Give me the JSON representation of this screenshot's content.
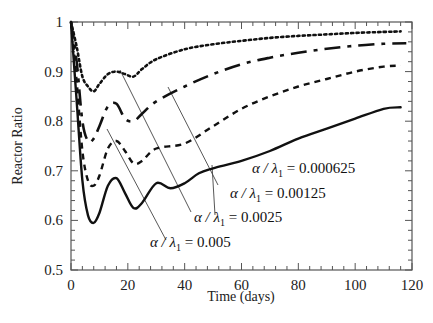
{
  "chart_data": {
    "type": "line",
    "title": "",
    "xlabel": "Time (days)",
    "ylabel": "Reactor Ratio",
    "xlim": [
      0,
      120
    ],
    "ylim": [
      0.5,
      1.0
    ],
    "xticks": [
      0,
      20,
      40,
      60,
      80,
      100,
      120
    ],
    "yticks": [
      0.5,
      0.6,
      0.7,
      0.8,
      0.9,
      1.0
    ],
    "xtick_labels": [
      "0",
      "20",
      "40",
      "60",
      "80",
      "100",
      "120"
    ],
    "ytick_labels": [
      "0.5",
      "0.6",
      "0.7",
      "0.8",
      "0.9",
      "1"
    ],
    "grid": false,
    "legend": "inline annotations with leader lines",
    "series": [
      {
        "name": "α/λ1 = 0.000625",
        "style": "dotted",
        "x": [
          0,
          2,
          4,
          6,
          8,
          10,
          13,
          16,
          19,
          22,
          25,
          30,
          40,
          50,
          60,
          70,
          80,
          90,
          100,
          110,
          116
        ],
        "y": [
          1.0,
          0.95,
          0.89,
          0.87,
          0.86,
          0.875,
          0.895,
          0.9,
          0.895,
          0.89,
          0.905,
          0.925,
          0.945,
          0.955,
          0.962,
          0.968,
          0.972,
          0.975,
          0.978,
          0.98,
          0.981
        ]
      },
      {
        "name": "α/λ1 = 0.00125",
        "style": "long-dash",
        "x": [
          0,
          2,
          4,
          6,
          8,
          10,
          13,
          16,
          19,
          22,
          25,
          30,
          40,
          50,
          60,
          70,
          80,
          90,
          100,
          110,
          118
        ],
        "y": [
          1.0,
          0.92,
          0.8,
          0.76,
          0.765,
          0.79,
          0.83,
          0.835,
          0.805,
          0.8,
          0.815,
          0.84,
          0.87,
          0.895,
          0.915,
          0.928,
          0.938,
          0.946,
          0.952,
          0.956,
          0.957
        ]
      },
      {
        "name": "α/λ1 = 0.0025",
        "style": "short-dash",
        "x": [
          0,
          2,
          4,
          6,
          8,
          10,
          13,
          16,
          19,
          22,
          25,
          30,
          40,
          50,
          60,
          70,
          80,
          90,
          100,
          110,
          116
        ],
        "y": [
          1.0,
          0.88,
          0.74,
          0.68,
          0.67,
          0.69,
          0.745,
          0.76,
          0.74,
          0.715,
          0.72,
          0.745,
          0.755,
          0.79,
          0.825,
          0.85,
          0.87,
          0.885,
          0.9,
          0.91,
          0.912
        ]
      },
      {
        "name": "α/λ1 = 0.005",
        "style": "solid",
        "x": [
          0,
          2,
          4,
          6,
          8,
          10,
          13,
          16,
          19,
          22,
          25,
          30,
          35,
          40,
          45,
          50,
          60,
          70,
          80,
          90,
          100,
          110,
          116
        ],
        "y": [
          1.0,
          0.84,
          0.68,
          0.61,
          0.595,
          0.615,
          0.67,
          0.685,
          0.655,
          0.625,
          0.635,
          0.675,
          0.665,
          0.675,
          0.695,
          0.705,
          0.72,
          0.74,
          0.765,
          0.785,
          0.805,
          0.825,
          0.828
        ]
      }
    ],
    "annotations": [
      {
        "text_italic": "α / λ",
        "sub": "1",
        "text_rest": " = 0.000625",
        "value": "0.000625",
        "label_x": 252,
        "label_y": 173,
        "leader_from": [
          215,
          215
        ],
        "leader_to": [
          212,
          165
        ]
      },
      {
        "text_italic": "α / λ",
        "sub": "1",
        "text_rest": " = 0.00125",
        "value": "0.00125",
        "label_x": 230,
        "label_y": 198,
        "leader_from": [
          218,
          185
        ],
        "leader_to": [
          168,
          87
        ]
      },
      {
        "text_italic": "α / λ",
        "sub": "1",
        "text_rest": " = 0.0025",
        "value": "0.0025",
        "label_x": 194,
        "label_y": 222,
        "leader_from": [
          191,
          212
        ],
        "leader_to": [
          120,
          70
        ]
      },
      {
        "text_italic": "α / λ",
        "sub": "1",
        "text_rest": " = 0.005",
        "value": "0.005",
        "label_x": 150,
        "label_y": 247,
        "leader_from": [
          166,
          240
        ],
        "leader_to": [
          107,
          129
        ]
      }
    ]
  },
  "axes": {
    "xlabel": "Time (days)",
    "ylabel": "Reactor Ratio"
  }
}
